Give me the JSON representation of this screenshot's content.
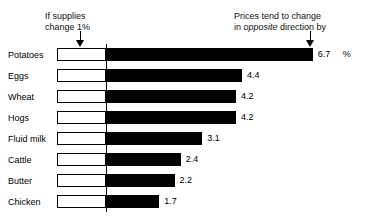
{
  "annotations": {
    "left_line1": "If supplies",
    "left_line2": "change 1%",
    "right_line1": "Prices tend to change",
    "right_pre": "in ",
    "right_emphasis": "opposite",
    "right_post": " direction by",
    "unit_symbol": "%"
  },
  "icons": {
    "arrow_left": "arrow-down-icon",
    "arrow_right": "arrow-down-icon"
  },
  "chart_data": {
    "type": "bar",
    "title": "",
    "subtitle": "",
    "orientation": "horizontal",
    "xlabel": "",
    "ylabel": "",
    "unit": "%",
    "grid": false,
    "legend": "none",
    "axis_origin_label": "1%",
    "xlim": [
      0,
      7
    ],
    "categories": [
      "Potatoes",
      "Eggs",
      "Wheat",
      "Hogs",
      "Fluid milk",
      "Cattle",
      "Butter",
      "Chicken"
    ],
    "values": [
      6.7,
      4.4,
      4.2,
      4.2,
      3.1,
      2.4,
      2.2,
      1.7
    ],
    "value_labels": [
      "6.7",
      "4.4",
      "4.2",
      "4.2",
      "3.1",
      "2.4",
      "2.2",
      "1.7"
    ],
    "supply_change_values": [
      1,
      1,
      1,
      1,
      1,
      1,
      1,
      1
    ],
    "series": [
      {
        "name": "Price change (opposite direction, %)",
        "values": [
          6.7,
          4.4,
          4.2,
          4.2,
          3.1,
          2.4,
          2.2,
          1.7
        ]
      }
    ],
    "colors": {
      "bar_fill": "#000000",
      "supply_box_fill": "#ffffff",
      "supply_box_stroke": "#000000",
      "axis": "#000000",
      "background": "#ffffff"
    }
  }
}
